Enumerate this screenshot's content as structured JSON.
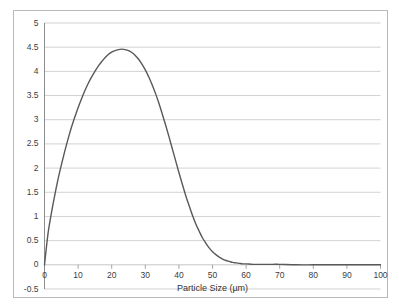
{
  "chart_data": {
    "type": "line",
    "title": "",
    "subtitle": "",
    "xlabel": "Particle Size (µm)",
    "ylabel": "",
    "xlim": [
      0,
      100
    ],
    "ylim": [
      -0.5,
      5
    ],
    "grid": true,
    "grid_axis": "y",
    "legend": false,
    "legend_position": "none",
    "line_color": "#595959",
    "background_color": "#ffffff",
    "gridline_color": "#bfbfbf",
    "border_color": "#b9b9b9",
    "axis_color": "#808080",
    "xticks": [
      0,
      10,
      20,
      30,
      40,
      50,
      60,
      70,
      80,
      90,
      100
    ],
    "xtick_labels": [
      "0",
      "10",
      "20",
      "30",
      "40",
      "50",
      "60",
      "70",
      "80",
      "90",
      "100"
    ],
    "yticks": [
      -0.5,
      0,
      0.5,
      1,
      1.5,
      2,
      2.5,
      3,
      3.5,
      4,
      4.5,
      5
    ],
    "ytick_labels": [
      "-0.5",
      "0",
      "0.5",
      "1",
      "1.5",
      "2",
      "2.5",
      "3",
      "3.5",
      "4",
      "4.5",
      "5"
    ],
    "series": [
      {
        "name": "Particle size distribution",
        "x": [
          0,
          1,
          2,
          3,
          4,
          5,
          6,
          7,
          8,
          9,
          10,
          11,
          12,
          13,
          14,
          15,
          16,
          17,
          18,
          19,
          20,
          21,
          22,
          23,
          24,
          25,
          26,
          27,
          28,
          29,
          30,
          31,
          32,
          33,
          34,
          35,
          36,
          37,
          38,
          39,
          40,
          41,
          42,
          43,
          44,
          45,
          46,
          47,
          48,
          49,
          50,
          51,
          52,
          53,
          54,
          55,
          56,
          57,
          58,
          59,
          60,
          62,
          64,
          66,
          68,
          70,
          75,
          80,
          85,
          90,
          95,
          100
        ],
        "y": [
          0,
          0.62,
          1.05,
          1.42,
          1.76,
          2.06,
          2.34,
          2.6,
          2.84,
          3.05,
          3.25,
          3.43,
          3.6,
          3.75,
          3.88,
          4.0,
          4.11,
          4.2,
          4.28,
          4.35,
          4.4,
          4.43,
          4.45,
          4.46,
          4.45,
          4.43,
          4.39,
          4.33,
          4.25,
          4.15,
          4.03,
          3.89,
          3.73,
          3.55,
          3.35,
          3.13,
          2.9,
          2.66,
          2.41,
          2.16,
          1.91,
          1.67,
          1.44,
          1.23,
          1.03,
          0.85,
          0.7,
          0.56,
          0.45,
          0.35,
          0.27,
          0.21,
          0.16,
          0.12,
          0.09,
          0.07,
          0.05,
          0.04,
          0.03,
          0.02,
          0.02,
          0.01,
          0.01,
          0.01,
          0.01,
          0.01,
          0.0,
          0.0,
          0.0,
          0.0,
          0.0,
          0.0
        ]
      }
    ],
    "annotations": {
      "peak_value": 4.46,
      "peak_x": 23
    }
  }
}
